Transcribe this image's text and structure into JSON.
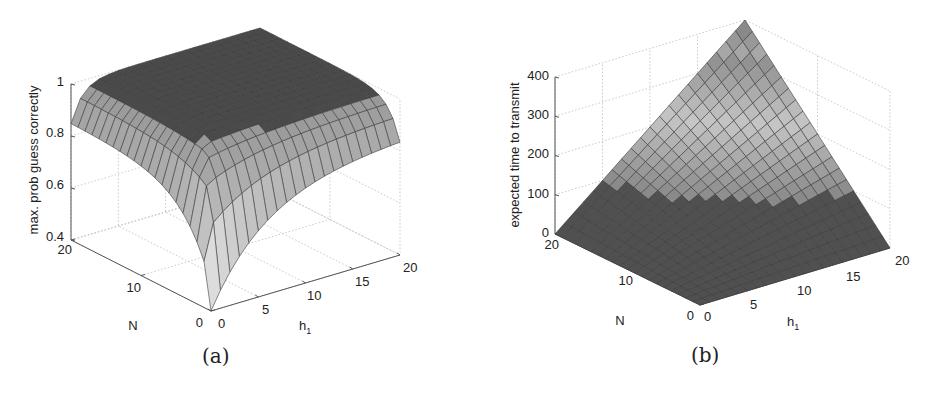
{
  "figures": [
    {
      "caption": "(a)",
      "zlabel": "max. prob guess correctly",
      "xlabel": "h",
      "xlabel_sub": "1",
      "ylabel": "N",
      "ztick_labels": [
        "0.4",
        "0.6",
        "0.8",
        "1"
      ],
      "ytick_labels": [
        "0",
        "10",
        "20"
      ],
      "xtick_labels": [
        "0",
        "5",
        "10",
        "15",
        "20"
      ]
    },
    {
      "caption": "(b)",
      "zlabel": "expected time to transmit",
      "xlabel": "h",
      "xlabel_sub": "1",
      "ylabel": "N",
      "ztick_labels": [
        "0",
        "100",
        "200",
        "300",
        "400"
      ],
      "ytick_labels": [
        "0",
        "10",
        "20"
      ],
      "xtick_labels": [
        "0",
        "5",
        "10",
        "15",
        "20"
      ]
    }
  ],
  "chart_data": [
    {
      "type": "surface",
      "title": "(a)",
      "xlabel": "h_1",
      "ylabel": "N",
      "zlabel": "max. prob guess correctly",
      "xlim": [
        0,
        20
      ],
      "ylim": [
        0,
        20
      ],
      "zlim": [
        0.4,
        1
      ],
      "xticks": [
        0,
        5,
        10,
        15,
        20
      ],
      "yticks": [
        0,
        10,
        20
      ],
      "zticks": [
        0.4,
        0.6,
        0.8,
        1
      ],
      "grid": true,
      "colormap": "gray",
      "description": "Surface is ~1 over most of the domain (plateau); falls along h_1=0 edge to ~0.5, and at the N=0 edge to ~0.4 near h_1=0, rising toward ~0.85 at h_1=20.",
      "sample_points": [
        {
          "h1": 0,
          "N": 20,
          "z": 0.5
        },
        {
          "h1": 0,
          "N": 0,
          "z": 0.4
        },
        {
          "h1": 20,
          "N": 0,
          "z": 0.85
        },
        {
          "h1": 20,
          "N": 20,
          "z": 1.0
        },
        {
          "h1": 1,
          "N": 20,
          "z": 0.95
        },
        {
          "h1": 10,
          "N": 10,
          "z": 1.0
        }
      ]
    },
    {
      "type": "surface",
      "title": "(b)",
      "xlabel": "h_1",
      "ylabel": "N",
      "zlabel": "expected time to transmit",
      "xlim": [
        0,
        20
      ],
      "ylim": [
        0,
        20
      ],
      "zlim": [
        0,
        400
      ],
      "xticks": [
        0,
        5,
        10,
        15,
        20
      ],
      "yticks": [
        0,
        10,
        20
      ],
      "zticks": [
        0,
        100,
        200,
        300,
        400
      ],
      "grid": true,
      "colormap": "gray",
      "description": "Bilinear surface z ≈ N·h_1; 0 along N=0 and h_1=0 edges, peak ≈ 400 at N=20, h_1=20.",
      "sample_points": [
        {
          "h1": 0,
          "N": 0,
          "z": 0
        },
        {
          "h1": 20,
          "N": 0,
          "z": 0
        },
        {
          "h1": 0,
          "N": 20,
          "z": 0
        },
        {
          "h1": 10,
          "N": 10,
          "z": 100
        },
        {
          "h1": 20,
          "N": 20,
          "z": 400
        }
      ]
    }
  ]
}
